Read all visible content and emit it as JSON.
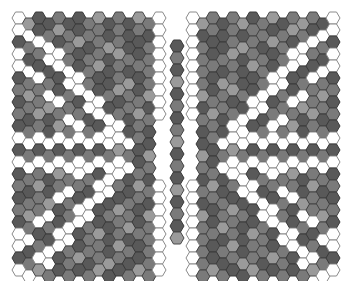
{
  "board": {
    "width": 348,
    "height": 281,
    "hex": {
      "w": 14,
      "h": 12,
      "col_step": 10,
      "row_step": 12,
      "odd_col_offset": 6
    },
    "palette": {
      "w": {
        "fill": "#ffffff",
        "stroke": "#8a8a8a"
      },
      "l": {
        "fill": "#9a9a9a",
        "stroke": "#4a4a4a"
      },
      "m": {
        "fill": "#7a7a7a",
        "stroke": "#444444"
      },
      "d": {
        "fill": "#595959",
        "stroke": "#3a3a3a"
      }
    },
    "blocks": [
      {
        "name": "left-block",
        "origin_x": 19,
        "origin_y": 18,
        "rows": [
          "wlddmddmldmdlmw",
          "wwdmlmdmmdmdmdw",
          "dmwwdmldmlmddmw",
          "wdmwwmdmmdlmdmw",
          "wwddwwdmldmdmmw",
          "dmwmdwwmddmldmw",
          "mlmwdmwwdmlmdlw",
          "dmmlwmdwwddmmdw",
          "mdldmwmdwwmdlmw",
          "dmmdlmwmdwwdmd.",
          "wwwwwwwwwwwwmd.",
          "dmdmdmdmdmlmdl.",
          "wwwwwwwwwwwwdm.",
          "dmmdlmwmdwwdmd.",
          "mdldmwmdwwmdlmw",
          "dmmlwmdwwddmmdw",
          "mlmwdmwwdmlmdlw",
          "dmwmdwwmddmldmw",
          "wwddwwdmldmdmmw",
          "wdmwwmdmmdlmdmw",
          "dmwwdmldmlmddmw",
          "wwlmdmdmlddmlmw"
        ]
      },
      {
        "name": "right-block",
        "origin_x": 193,
        "origin_y": 18,
        "rows": [
          "wlmdmldmldmlmdw",
          "wdmdmdmmdmlmdww",
          "wmddmlmdlmdwwmd",
          "wmdmldmmdmwwmdw",
          "wmmdmdlmdwwddww",
          "wmdlmddmwwdmwmd",
          "wldmlmdwwmdwmlm",
          "wdmmddwwdmwlmmd",
          "wmldmwwdmwmdldm",
          ".dmdwwdmwmldmmd",
          ".dmwwwwwwwwwwww",
          ".ldmlmdmdmdmdmd",
          ".mdwwwwwwwwwwww",
          ".dmdwwdmwmldmmd",
          "wmldmwwdmwmdldm",
          "wdmmddwwdmwlmmd",
          "wldmlmdwwmdwmlm",
          "wmdlmddmwwdmwmd",
          "wmmdmdlmdwwddww",
          "wmdmldmmdmwwmdw",
          "wmddmlmdlmdwwmd",
          "wmlmddlmdmdmlww"
        ]
      },
      {
        "name": "center-column",
        "origin_x": 177,
        "origin_y": 46,
        "rows": [
          "d",
          "m",
          "d",
          "l",
          "d",
          "m",
          "d",
          "m",
          "l",
          "d",
          "m",
          "d",
          "l",
          "d",
          "m",
          "d",
          "l"
        ]
      }
    ]
  }
}
